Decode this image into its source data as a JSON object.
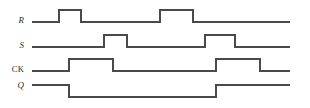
{
  "figure": {
    "type": "digital-timing-diagram",
    "background_color": "#ffffff",
    "trace_color": "#4a4a4a",
    "trace_width": 1.2,
    "width": 310,
    "height": 108,
    "x_start": 32,
    "x_end": 290
  },
  "signals": [
    {
      "name": "R",
      "label": "R",
      "label_style": "italic",
      "low_y": 22,
      "high_y": 10,
      "initial_level": "low",
      "final_level": "low",
      "transitions": [
        {
          "x": 59,
          "edge": "rise"
        },
        {
          "x": 81,
          "edge": "fall"
        },
        {
          "x": 160,
          "edge": "rise"
        },
        {
          "x": 193,
          "edge": "fall"
        }
      ]
    },
    {
      "name": "S",
      "label": "S",
      "label_style": "italic",
      "low_y": 47,
      "high_y": 35,
      "initial_level": "low",
      "final_level": "low",
      "transitions": [
        {
          "x": 104,
          "edge": "rise"
        },
        {
          "x": 127,
          "edge": "fall"
        },
        {
          "x": 205,
          "edge": "rise"
        },
        {
          "x": 235,
          "edge": "fall"
        }
      ]
    },
    {
      "name": "CK",
      "label": "CK",
      "label_style": "upright",
      "low_y": 71,
      "high_y": 59,
      "initial_level": "low",
      "final_level": "low",
      "transitions": [
        {
          "x": 69,
          "edge": "rise"
        },
        {
          "x": 113,
          "edge": "fall"
        },
        {
          "x": 216,
          "edge": "rise"
        },
        {
          "x": 260,
          "edge": "fall"
        }
      ]
    },
    {
      "name": "Q",
      "label": "Q",
      "label_style": "italic",
      "low_y": 97,
      "high_y": 85,
      "initial_level": "high",
      "final_level": "high",
      "transitions": [
        {
          "x": 69,
          "edge": "fall"
        },
        {
          "x": 216,
          "edge": "rise"
        }
      ]
    }
  ]
}
